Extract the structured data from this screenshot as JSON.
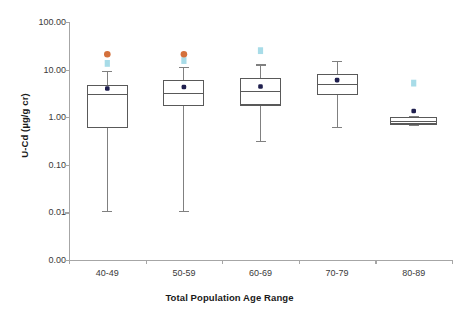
{
  "chart_data": {
    "type": "box",
    "title": "",
    "xlabel": "Total Population Age Range",
    "ylabel": "U-Cd (µg/g cr)",
    "yscale": "log",
    "ylim": [
      0.001,
      100.0
    ],
    "y_ticks": [
      "100.00",
      "10.00",
      "1.00",
      "0.10",
      "0.01",
      "0.00"
    ],
    "y_tick_values": [
      100.0,
      10.0,
      1.0,
      0.1,
      0.01,
      0.001
    ],
    "grid": false,
    "legend": "none",
    "categories": [
      "40-49",
      "50-59",
      "60-69",
      "70-79",
      "80-89"
    ],
    "series": [
      {
        "name": "40-49",
        "category": "40-49",
        "whisker_high": 9.0,
        "q3": 4.7,
        "median": 3.0,
        "q1": 0.62,
        "whisker_low": 0.0105,
        "mean": 4.0,
        "outlier_orange": 21.0,
        "outlier_cyan": 13.5
      },
      {
        "name": "50-59",
        "category": "50-59",
        "whisker_high": 11.0,
        "q3": 6.0,
        "median": 3.1,
        "q1": 1.75,
        "whisker_low": 0.0105,
        "mean": 4.3,
        "outlier_orange": 21.0,
        "outlier_cyan": 15.5
      },
      {
        "name": "60-69",
        "category": "60-69",
        "whisker_high": 12.5,
        "q3": 6.4,
        "median": 3.5,
        "q1": 1.8,
        "whisker_low": 0.31,
        "mean": 4.4,
        "outlier_orange": null,
        "outlier_cyan": 25.0
      },
      {
        "name": "70-79",
        "category": "70-79",
        "whisker_high": 15.0,
        "q3": 8.0,
        "median": 4.8,
        "q1": 3.0,
        "whisker_low": 0.62,
        "mean": 6.0,
        "outlier_orange": null,
        "outlier_cyan": null
      },
      {
        "name": "80-89",
        "category": "80-89",
        "whisker_high": 1.05,
        "q3": 1.0,
        "median": 0.82,
        "q1": 0.72,
        "whisker_low": 0.68,
        "mean": 1.35,
        "outlier_orange": null,
        "outlier_cyan": 5.2
      }
    ],
    "colors": {
      "box_stroke": "#595959",
      "whisker_stroke": "#808080",
      "mean_marker": "#1f1f4e",
      "outlier_orange": "#d4713c",
      "outlier_cyan": "#a8dce8",
      "axis": "#a6a6a6",
      "text": "#3a3a3a",
      "background": "#ffffff"
    }
  }
}
